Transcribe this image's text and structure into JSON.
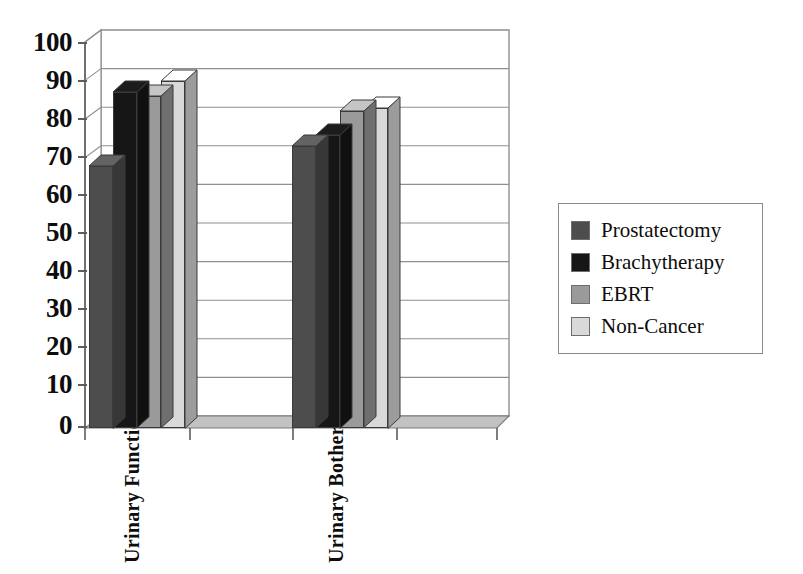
{
  "chart_data": {
    "type": "bar",
    "title": "",
    "subtitle": "",
    "xlabel": "",
    "ylabel": "",
    "categories": [
      "Urinary Function",
      "Urinary Bother"
    ],
    "series": [
      {
        "name": "Prostatectomy",
        "color": "#4d4d4d",
        "values": [
          68,
          73
        ]
      },
      {
        "name": "Brachytherapy",
        "color": "#161616",
        "values": [
          87,
          76
        ]
      },
      {
        "name": "EBRT",
        "color": "#9a9a9a",
        "values": [
          86,
          82
        ]
      },
      {
        "name": "Non-Cancer",
        "color": "#d9d9d9",
        "values": [
          90,
          83
        ]
      }
    ],
    "ylim": [
      0,
      100
    ],
    "yticks": [
      0,
      10,
      20,
      30,
      40,
      50,
      60,
      70,
      80,
      90,
      100
    ],
    "ytick_labels": [
      "0",
      "10",
      "20",
      "30",
      "40",
      "50",
      "60",
      "70",
      "80",
      "90",
      "100"
    ],
    "grid": true,
    "grid_axis": "y",
    "legend_position": "right",
    "three_d": true
  },
  "legend": {
    "items": [
      {
        "label": "Prostatectomy",
        "color": "#4d4d4d"
      },
      {
        "label": "Brachytherapy",
        "color": "#161616"
      },
      {
        "label": "EBRT",
        "color": "#9a9a9a"
      },
      {
        "label": "Non-Cancer",
        "color": "#d9d9d9"
      }
    ]
  },
  "axes": {
    "y": {
      "ticks": [
        "100",
        "90",
        "80",
        "70",
        "60",
        "50",
        "40",
        "30",
        "20",
        "10",
        "0"
      ]
    },
    "x": {
      "labels": [
        "Urinary Function",
        "Urinary Bother"
      ]
    }
  },
  "colors": {
    "axis": "#5d5d5d",
    "grid": "#8f8f8f",
    "wall": "#ffffff",
    "floor": "#c9c9c9",
    "outline": "#3a3a3a",
    "text": "#0d0d0d"
  }
}
